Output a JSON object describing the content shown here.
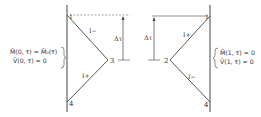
{
  "left_panel": {
    "points": {
      "p1": {
        "label": "1",
        "x": 67,
        "y": 15
      },
      "p3": {
        "label": "3",
        "x": 108,
        "y": 60
      },
      "p4": {
        "label": "4",
        "x": 67,
        "y": 102
      }
    },
    "upper_line_label": "I−",
    "lower_line_label": "I+",
    "delta_label": "Δτ",
    "boundary_conditions": [
      "M̄(0, τ) = M̄₀(τ)",
      "V̄(0, τ) = 0"
    ]
  },
  "right_panel": {
    "points": {
      "p1": {
        "label": "1",
        "x": 210,
        "y": 16
      },
      "p2": {
        "label": "2",
        "x": 170,
        "y": 60
      },
      "p4": {
        "label": "4",
        "x": 210,
        "y": 102
      }
    },
    "upper_line_label": "I+",
    "lower_line_label": "I−",
    "delta_label": "Δτ",
    "boundary_conditions": [
      "M̄(1, τ) = 0",
      "V̄(1, τ) = 0"
    ]
  },
  "colors": {
    "line": "#444444",
    "text": "#333333",
    "background": "#ffffff"
  }
}
